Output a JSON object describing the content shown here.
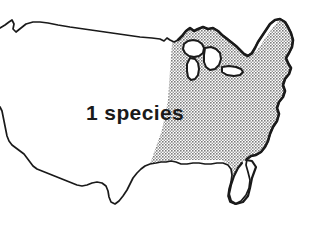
{
  "figure": {
    "type": "distribution-map",
    "background_color": "#ffffff",
    "outline_color": "#1a1a1a"
  },
  "labels": {
    "species_count": "1 species"
  },
  "legend": {
    "shaded_region_meaning": "1 species",
    "shaded_region_name": "eastern United States",
    "shade_color": "#a9a9a9",
    "unshaded_color": "#ffffff"
  },
  "map_data": {
    "type": "choropleth",
    "regions": [
      {
        "name": "eastern-united-states",
        "value": 1,
        "value_label": "1 species",
        "fill": "#a9a9a9",
        "pattern": "halftone-stipple"
      },
      {
        "name": "western-united-states",
        "value": 0,
        "value_label": "",
        "fill": "#ffffff",
        "pattern": "none"
      },
      {
        "name": "florida-peninsula",
        "value": 0,
        "value_label": "",
        "fill": "#ffffff",
        "pattern": "none"
      },
      {
        "name": "great-lakes",
        "value": 0,
        "value_label": "",
        "fill": "#ffffff",
        "pattern": "none"
      }
    ]
  }
}
